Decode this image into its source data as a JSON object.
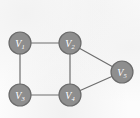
{
  "figure": {
    "title": "",
    "caption": "",
    "background_color": "#fcfcfc"
  },
  "style": {
    "vertex_fill": "#8e8e8e",
    "vertex_stroke": "#6b6b6b",
    "vertex_radius": 11,
    "vertex_label_color": "#ffffff",
    "edge_color": "#6e6e6e",
    "edge_width": 1.2
  },
  "chart_data": {
    "type": "diagram",
    "diagram_kind": "undirected-graph",
    "title": "",
    "nodes": [
      {
        "id": "v1",
        "label": "V",
        "subscript": "1",
        "x": 20,
        "y": 43
      },
      {
        "id": "v2",
        "label": "V",
        "subscript": "2",
        "x": 70,
        "y": 43
      },
      {
        "id": "v3",
        "label": "V",
        "subscript": "3",
        "x": 20,
        "y": 95
      },
      {
        "id": "v4",
        "label": "V",
        "subscript": "4",
        "x": 70,
        "y": 95
      },
      {
        "id": "v5",
        "label": "V",
        "subscript": "5",
        "x": 122,
        "y": 72
      }
    ],
    "edges": [
      {
        "id": "e1",
        "from": "v1",
        "to": "v2",
        "x1": 20,
        "y1": 43,
        "x2": 70,
        "y2": 43
      },
      {
        "id": "e2",
        "from": "v1",
        "to": "v3",
        "x1": 20,
        "y1": 43,
        "x2": 20,
        "y2": 95
      },
      {
        "id": "e3",
        "from": "v3",
        "to": "v4",
        "x1": 20,
        "y1": 95,
        "x2": 70,
        "y2": 95
      },
      {
        "id": "e4",
        "from": "v2",
        "to": "v4",
        "x1": 70,
        "y1": 43,
        "x2": 70,
        "y2": 95
      },
      {
        "id": "e5",
        "from": "v2",
        "to": "v5",
        "x1": 70,
        "y1": 43,
        "x2": 122,
        "y2": 72
      },
      {
        "id": "e6",
        "from": "v4",
        "to": "v5",
        "x1": 70,
        "y1": 95,
        "x2": 122,
        "y2": 72
      }
    ],
    "node_count": 5,
    "edge_count": 6
  }
}
